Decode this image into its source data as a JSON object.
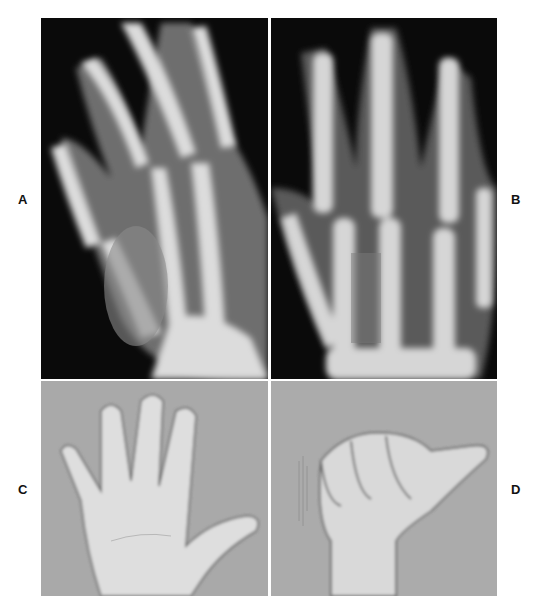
{
  "figure": {
    "panels": [
      {
        "id": "A",
        "label": "A",
        "kind": "x-ray",
        "view": "oblique hand radiograph"
      },
      {
        "id": "B",
        "label": "B",
        "kind": "x-ray",
        "view": "posteroanterior hand radiograph"
      },
      {
        "id": "C",
        "label": "C",
        "kind": "photograph",
        "view": "open palm, fingers spread"
      },
      {
        "id": "D",
        "label": "D",
        "kind": "photograph",
        "view": "fist with extended thumb"
      }
    ]
  },
  "colors": {
    "xray_background": "#0a0a0a",
    "bone": "#d9d9d9",
    "photo_background": "#a8a8a8",
    "skin": "#e2e2e2",
    "label": "#111111"
  }
}
